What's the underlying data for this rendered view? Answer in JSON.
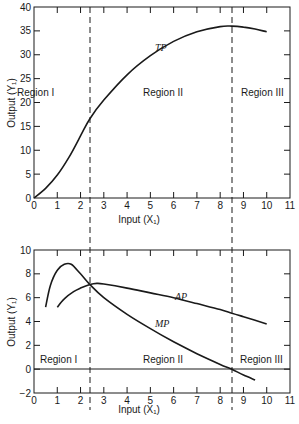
{
  "chart_data": [
    {
      "type": "line",
      "title": "",
      "xlabel": "Input (X₁)",
      "ylabel": "Output (Y₁)",
      "xlim": [
        0,
        11
      ],
      "ylim": [
        0,
        40
      ],
      "xticks": [
        0,
        1,
        2,
        3,
        4,
        5,
        6,
        7,
        8,
        9,
        10,
        11
      ],
      "yticks": [
        0,
        5,
        10,
        15,
        20,
        25,
        30,
        35,
        40
      ],
      "grid": false,
      "series": [
        {
          "name": "TP",
          "x": [
            0,
            0.5,
            1,
            1.5,
            2,
            2.4,
            3,
            4,
            5,
            6,
            7,
            8,
            8.5,
            9,
            9.5,
            10
          ],
          "values": [
            0,
            2,
            4.8,
            8.5,
            13,
            16.6,
            20.5,
            25.8,
            29.8,
            32.8,
            34.8,
            35.9,
            36,
            35.8,
            35.4,
            34.8
          ]
        }
      ],
      "annotations": [
        {
          "text": "TP",
          "x": 5.2,
          "y": 30.5
        },
        {
          "text": "Region I",
          "x": 0.3,
          "y": 22
        },
        {
          "text": "Region II",
          "x": 4.4,
          "y": 22
        },
        {
          "text": "Region III",
          "x": 8.8,
          "y": 22
        }
      ],
      "vlines": [
        {
          "x": 2.4,
          "style": "dashed"
        },
        {
          "x": 8.5,
          "style": "dashed"
        }
      ]
    },
    {
      "type": "line",
      "title": "",
      "xlabel": "Input (X₁)",
      "ylabel": "Output (Y₁)",
      "xlim": [
        0,
        11
      ],
      "ylim": [
        -2,
        10
      ],
      "xticks": [
        0,
        1,
        2,
        3,
        4,
        5,
        6,
        7,
        8,
        9,
        10,
        11
      ],
      "yticks": [
        -2,
        0,
        2,
        4,
        6,
        8,
        10
      ],
      "grid": false,
      "hlines": [
        {
          "y": 0,
          "style": "solid"
        }
      ],
      "series": [
        {
          "name": "MP",
          "x": [
            0.5,
            0.7,
            1.0,
            1.3,
            1.6,
            2.0,
            2.4,
            3,
            4,
            5,
            6,
            7,
            8,
            8.5,
            9,
            9.5
          ],
          "values": [
            5.2,
            7.0,
            8.3,
            8.8,
            8.8,
            8.0,
            7.1,
            6.0,
            4.6,
            3.4,
            2.3,
            1.3,
            0.4,
            0,
            -0.5,
            -0.9
          ]
        },
        {
          "name": "AP",
          "x": [
            1.0,
            1.3,
            1.7,
            2.0,
            2.4,
            2.7,
            3,
            4,
            5,
            6,
            7,
            8,
            8.5,
            9,
            10
          ],
          "values": [
            5.2,
            5.9,
            6.5,
            6.8,
            7.1,
            7.2,
            7.15,
            6.8,
            6.4,
            6.0,
            5.5,
            5.0,
            4.7,
            4.4,
            3.8
          ]
        }
      ],
      "annotations": [
        {
          "text": "AP",
          "x": 7.3,
          "y": 6.0
        },
        {
          "text": "MP",
          "x": 5.2,
          "y": 3.7
        },
        {
          "text": "Region I",
          "x": 0.3,
          "y": 0.5
        },
        {
          "text": "Region II",
          "x": 4.4,
          "y": 0.5
        },
        {
          "text": "Region III",
          "x": 8.8,
          "y": 0.5
        }
      ],
      "vlines": [
        {
          "x": 2.4,
          "style": "dashed"
        },
        {
          "x": 8.5,
          "style": "dashed"
        }
      ]
    }
  ],
  "labels": {
    "top_ylabel": "Output (Y₁)",
    "top_xlabel": "Input (X₁)",
    "bottom_ylabel": "Output (Y₁)",
    "bottom_xlabel": "Input (X₁)",
    "tp": "TP",
    "ap": "AP",
    "mp": "MP",
    "region1": "Region I",
    "region2": "Region II",
    "region3": "Region III"
  },
  "colors": {
    "ink": "#1a1a1a",
    "background": "#ffffff"
  }
}
